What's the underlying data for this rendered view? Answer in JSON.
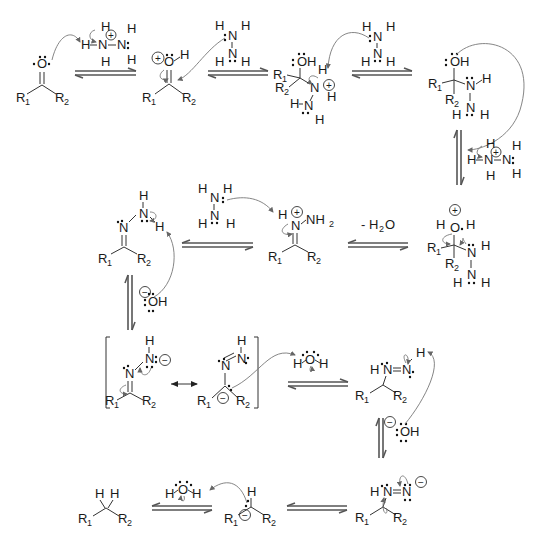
{
  "diagram": {
    "labels": {
      "R1": "R",
      "R2": "R",
      "sub1": "1",
      "sub2": "2",
      "O": "O",
      "OH": "OH",
      "N": "N",
      "H": "H",
      "NH": "NH",
      "NH2_sub": "2",
      "plus": "+",
      "minus": "−",
      "water_loss": "- H",
      "water_loss_sub": "2",
      "water_loss_O": "O"
    },
    "steps": [
      {
        "id": "ketone",
        "description": "Ketone R1-CO-R2"
      },
      {
        "id": "protonated-ketone",
        "description": "Protonated carbonyl"
      },
      {
        "id": "tetrahedral-hydrazinium",
        "description": "Hydrazine adduct (N protonated)"
      },
      {
        "id": "carbinolamine",
        "description": "Neutral carbinolamine"
      },
      {
        "id": "protonated-carbinolamine",
        "description": "O-protonated carbinolamine"
      },
      {
        "id": "iminium",
        "description": "Iminium ion"
      },
      {
        "id": "hydrazone",
        "description": "Hydrazone"
      },
      {
        "id": "hydrazone-anion-resonance",
        "description": "Resonance structures of hydrazone anion"
      },
      {
        "id": "diimide",
        "description": "Diimide intermediate"
      },
      {
        "id": "diimide-anion",
        "description": "Diimide anion"
      },
      {
        "id": "carbanion",
        "description": "Carbanion"
      },
      {
        "id": "alkane",
        "description": "Alkane R1-CH2-R2"
      }
    ],
    "reagents": {
      "hydrazinium": "H3N+-NH2",
      "hydrazine": "H2N-NH2",
      "hydroxide": "OH−",
      "water": "H2O",
      "elimination": "- H2O"
    }
  }
}
